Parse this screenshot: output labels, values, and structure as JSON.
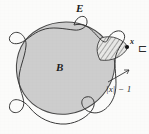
{
  "figure": {
    "kind": "mathematical-diagram",
    "background_color": "#fbfbfa",
    "labels": {
      "set_E": "E",
      "set_B": "B",
      "point_x": "x",
      "bracket_C": "⊏",
      "distance": "|x| − 1"
    },
    "colors": {
      "disc_fill": "#cdcdcd",
      "disc_stroke": "#4a4a4a",
      "curve_stroke": "#3a3a3a",
      "hatch_stroke": "#3d3d3d",
      "label_color": "#1d1d1d",
      "leader_color": "#2b2b2b"
    },
    "geometry": {
      "disc_center_x": 66,
      "disc_center_y": 69,
      "disc_radius_x": 50,
      "disc_radius_y": 47,
      "point_x_px": [
        127,
        47
      ],
      "hatched_lobe_center": [
        115,
        52
      ]
    }
  }
}
